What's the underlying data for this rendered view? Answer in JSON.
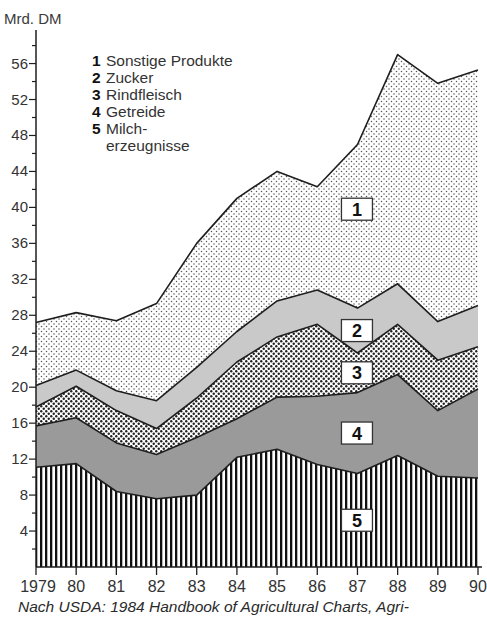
{
  "chart_data": {
    "type": "area",
    "stacked": true,
    "ylabel": "Mrd. DM",
    "xlabel": "",
    "ylim": [
      0,
      58
    ],
    "yticks": [
      4,
      8,
      12,
      16,
      20,
      24,
      28,
      32,
      36,
      40,
      44,
      48,
      52,
      56
    ],
    "x": [
      1979,
      1980,
      1981,
      1982,
      1983,
      1984,
      1985,
      1986,
      1987,
      1988,
      1989,
      1990
    ],
    "xtick_labels": [
      "1979",
      "80",
      "81",
      "82",
      "83",
      "84",
      "85",
      "86",
      "87",
      "88",
      "89",
      "90"
    ],
    "legend_placement": "top-left",
    "series": [
      {
        "id": "5",
        "name": "Milcherzeugnisse",
        "legend_label": "Milch-\nerzeugnisse",
        "pattern": "vertical-stripes",
        "values": [
          11.1,
          11.5,
          8.4,
          7.6,
          8.0,
          12.2,
          13.1,
          11.4,
          10.4,
          12.4,
          10.1,
          9.9
        ]
      },
      {
        "id": "4",
        "name": "Getreide",
        "legend_label": "Getreide",
        "pattern": "medium-gray",
        "values": [
          4.6,
          5.1,
          5.4,
          4.9,
          6.4,
          4.3,
          5.8,
          7.6,
          9.0,
          9.0,
          7.3,
          9.9
        ]
      },
      {
        "id": "3",
        "name": "Rindfleisch",
        "legend_label": "Rindfleisch",
        "pattern": "dense-dots",
        "values": [
          2.1,
          3.5,
          3.6,
          2.9,
          4.4,
          6.3,
          6.7,
          8.0,
          4.4,
          5.6,
          5.6,
          4.7
        ]
      },
      {
        "id": "2",
        "name": "Zucker",
        "legend_label": "Zucker",
        "pattern": "light-gray",
        "values": [
          2.4,
          1.8,
          2.2,
          3.1,
          3.4,
          3.4,
          4.0,
          3.8,
          5.0,
          4.5,
          4.3,
          4.6
        ]
      },
      {
        "id": "1",
        "name": "Sonstige Produkte",
        "legend_label": "Sonstige Produkte",
        "pattern": "light-dots",
        "values": [
          7.0,
          6.4,
          7.8,
          10.8,
          13.8,
          14.8,
          14.4,
          11.5,
          18.2,
          25.5,
          26.5,
          26.2
        ]
      }
    ],
    "legend_order": [
      "1",
      "2",
      "3",
      "4",
      "5"
    ],
    "area_labels": [
      "1",
      "2",
      "3",
      "4",
      "5"
    ],
    "source": "Nach USDA: 1984 Handbook of Agricultural Charts, Agri-"
  },
  "colors": {
    "line": "#1e1e1e",
    "gray_medium": "#9a9a9a",
    "gray_light": "#c9c9c9",
    "dot": "#555555",
    "dense_dot": "#222222"
  }
}
